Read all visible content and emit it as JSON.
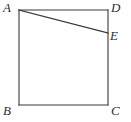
{
  "figure": {
    "type": "geometry-diagram",
    "width": 131,
    "height": 122,
    "style": {
      "stroke_color": "#3a3a3a",
      "stroke_width": 1,
      "fill": "none",
      "background": "#ffffff",
      "label_color": "#2e2e2e"
    },
    "square": {
      "name": "square-abcd",
      "top_left": {
        "x": 19,
        "y": 10
      },
      "top_right": {
        "x": 108,
        "y": 10
      },
      "bottom_right": {
        "x": 108,
        "y": 105
      },
      "bottom_left": {
        "x": 19,
        "y": 105
      }
    },
    "segment": {
      "name": "segment-ae",
      "from": {
        "x": 19,
        "y": 10
      },
      "to": {
        "x": 108,
        "y": 33
      }
    },
    "points": [
      {
        "id": "A",
        "label": "A",
        "x": 19,
        "y": 10,
        "position": "top-left-vertex"
      },
      {
        "id": "D",
        "label": "D",
        "x": 108,
        "y": 10,
        "position": "top-right-vertex"
      },
      {
        "id": "E",
        "label": "E",
        "x": 108,
        "y": 33,
        "position": "on-right-side"
      },
      {
        "id": "B",
        "label": "B",
        "x": 19,
        "y": 105,
        "position": "bottom-left-vertex"
      },
      {
        "id": "C",
        "label": "C",
        "x": 108,
        "y": 105,
        "position": "bottom-right-vertex"
      }
    ]
  }
}
